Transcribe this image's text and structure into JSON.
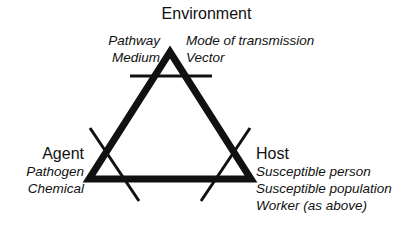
{
  "diagram": {
    "type": "triangle-diagram",
    "stroke_color": "#111111",
    "background_color": "#ffffff",
    "nodes": {
      "environment": {
        "label": "Environment",
        "left_items": [
          "Pathway",
          "Medium"
        ],
        "right_items": [
          "Mode of transmission",
          "Vector"
        ]
      },
      "agent": {
        "label": "Agent",
        "items": [
          "Pathogen",
          "Chemical"
        ]
      },
      "host": {
        "label": "Host",
        "items": [
          "Susceptible person",
          "Susceptible population",
          "Worker (as above)"
        ]
      }
    },
    "geometry": {
      "apex": [
        170,
        52
      ],
      "left_vertex": [
        89,
        179
      ],
      "right_vertex": [
        251,
        179
      ],
      "edge_width": 7,
      "tick_width": 3,
      "apex_tick": [
        130,
        76,
        212,
        76
      ],
      "left_tick": [
        90,
        128,
        139,
        201
      ],
      "right_tick": [
        250,
        128,
        201,
        201
      ]
    }
  }
}
